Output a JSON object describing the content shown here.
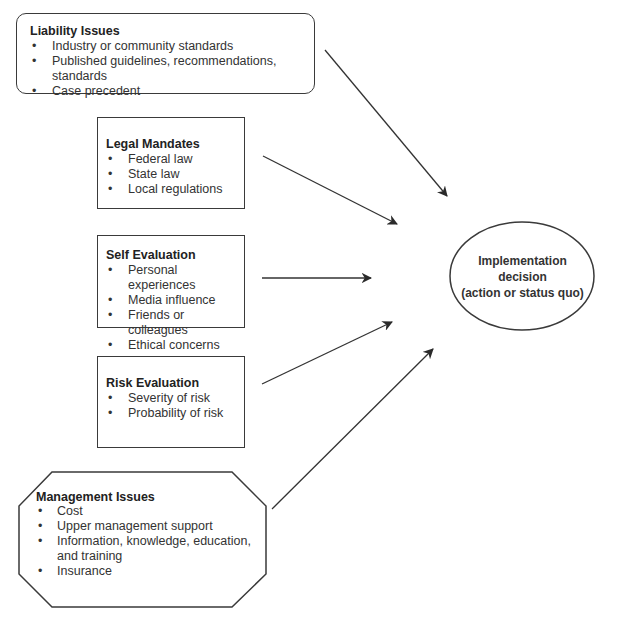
{
  "diagram": {
    "type": "influence-flow",
    "factors": [
      {
        "id": "liability",
        "title": "Liability Issues",
        "shape": "rounded-rectangle",
        "items": [
          "Industry or community standards",
          "Published guidelines, recommendations, standards",
          "Case precedent"
        ]
      },
      {
        "id": "legal",
        "title": "Legal Mandates",
        "shape": "rectangle",
        "items": [
          "Federal law",
          "State law",
          "Local regulations"
        ]
      },
      {
        "id": "self",
        "title": "Self Evaluation",
        "shape": "rectangle",
        "items": [
          "Personal experiences",
          "Media influence",
          "Friends or colleagues",
          "Ethical concerns"
        ]
      },
      {
        "id": "risk",
        "title": "Risk Evaluation",
        "shape": "rectangle",
        "items": [
          "Severity of risk",
          "Probability of risk"
        ]
      },
      {
        "id": "management",
        "title": "Management Issues",
        "shape": "octagon",
        "items": [
          "Cost",
          "Upper management support",
          "Information, knowledge, education, and training",
          "Insurance"
        ]
      }
    ],
    "outcome": {
      "shape": "ellipse",
      "lines": [
        "Implementation",
        "decision",
        "(action or status quo)"
      ]
    },
    "edges": [
      {
        "from": "liability",
        "to": "outcome"
      },
      {
        "from": "legal",
        "to": "outcome"
      },
      {
        "from": "self",
        "to": "outcome"
      },
      {
        "from": "risk",
        "to": "outcome"
      },
      {
        "from": "management",
        "to": "outcome"
      }
    ],
    "colors": {
      "stroke": "#3a3a3a",
      "text": "#333333",
      "background": "#ffffff"
    }
  }
}
